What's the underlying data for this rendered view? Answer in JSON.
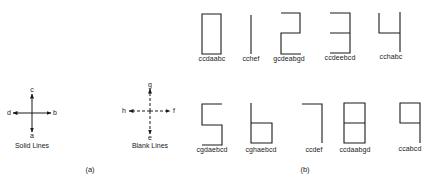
{
  "panel_a": {
    "caption": "(a)",
    "solid": {
      "title": "Solid Lines",
      "directions": {
        "up": "c",
        "right": "b",
        "down": "a",
        "left": "d"
      }
    },
    "blank": {
      "title": "Blank Lines",
      "directions": {
        "up": "g",
        "right": "f",
        "down": "e",
        "left": "h"
      }
    }
  },
  "panel_b": {
    "caption": "(b)",
    "digits": [
      {
        "digit": "0",
        "code": "ccdaabc"
      },
      {
        "digit": "1",
        "code": "cchef"
      },
      {
        "digit": "2",
        "code": "gcdeabgd"
      },
      {
        "digit": "3",
        "code": "ccdeebcd"
      },
      {
        "digit": "4",
        "code": "cchabc"
      },
      {
        "digit": "5",
        "code": "cgdaebcd"
      },
      {
        "digit": "6",
        "code": "cghaebcd"
      },
      {
        "digit": "7",
        "code": "ccdef"
      },
      {
        "digit": "8",
        "code": "ccdaabgd"
      },
      {
        "digit": "9",
        "code": "ccabcd"
      }
    ]
  },
  "colors": {
    "stroke": "#1a1a1a",
    "background": "#ffffff"
  }
}
